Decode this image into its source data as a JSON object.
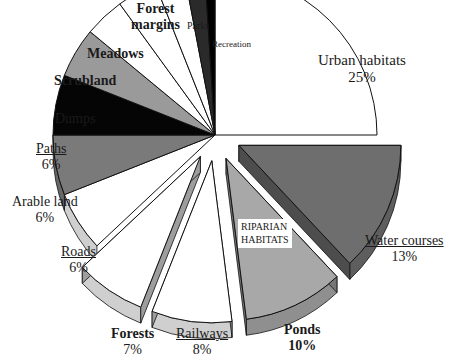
{
  "chart_data": {
    "type": "pie",
    "title": "",
    "style": "3D exploded pie, grayscale",
    "start_angle_deg": 0,
    "direction": "clockwise",
    "group_annotation": "RIPARIAN HABITATS",
    "slices": [
      {
        "label": "Urban habitats",
        "value": 25,
        "pct_label": "25%",
        "fill": "#ffffff",
        "exploded": false,
        "bold": false,
        "underline": false
      },
      {
        "label": "Water courses",
        "value": 13,
        "pct_label": "13%",
        "fill": "#6e6e6e",
        "exploded": true,
        "bold": false,
        "underline": true
      },
      {
        "label": "Ponds",
        "value": 10,
        "pct_label": "10%",
        "fill": "#a8a8a8",
        "exploded": true,
        "bold": true,
        "underline": false
      },
      {
        "label": "Railways",
        "value": 8,
        "pct_label": "8%",
        "fill": "#ffffff",
        "exploded": true,
        "bold": false,
        "underline": true
      },
      {
        "label": "Forests",
        "value": 7,
        "pct_label": "7%",
        "fill": "#ffffff",
        "exploded": true,
        "bold": true,
        "underline": false
      },
      {
        "label": "Roads",
        "value": 6,
        "pct_label": "6%",
        "fill": "#ffffff",
        "exploded": false,
        "bold": false,
        "underline": true
      },
      {
        "label": "Arable land",
        "value": 6,
        "pct_label": "6%",
        "fill": "#7a7a7a",
        "exploded": false,
        "bold": false,
        "underline": false
      },
      {
        "label": "Paths",
        "value": 6,
        "pct_label": "6%",
        "fill": "#050505",
        "exploded": false,
        "bold": false,
        "underline": true
      },
      {
        "label": "Dumps",
        "value": 5,
        "pct_label": "",
        "fill": "#9a9a9a",
        "exploded": false,
        "bold": false,
        "underline": false
      },
      {
        "label": "Scrubland",
        "value": 4,
        "pct_label": "",
        "fill": "#ffffff",
        "exploded": false,
        "bold": true,
        "underline": false
      },
      {
        "label": "Meadows",
        "value": 4,
        "pct_label": "",
        "fill": "#ffffff",
        "exploded": false,
        "bold": true,
        "underline": false
      },
      {
        "label": "Forest margins",
        "value": 3,
        "pct_label": "",
        "fill": "#ffffff",
        "exploded": false,
        "bold": true,
        "underline": false
      },
      {
        "label": "Parks",
        "value": 2,
        "pct_label": "",
        "fill": "#2a2a2a",
        "exploded": false,
        "bold": false,
        "underline": false
      },
      {
        "label": "Recreation",
        "value": 1,
        "pct_label": "",
        "fill": "#000000",
        "exploded": false,
        "bold": false,
        "underline": false
      }
    ]
  },
  "labels": {
    "urban": {
      "name": "Urban habitats",
      "pct": "25%"
    },
    "water": {
      "name": "Water courses",
      "pct": "13%"
    },
    "ponds": {
      "name": "Ponds",
      "pct": "10%"
    },
    "railways": {
      "name": "Railways",
      "pct": "8%"
    },
    "forests": {
      "name": "Forests",
      "pct": "7%"
    },
    "roads": {
      "name": "Roads",
      "pct": "6%"
    },
    "arable": {
      "name": "Arable land",
      "pct": "6%"
    },
    "paths": {
      "name": "Paths",
      "pct": "6%"
    },
    "dumps": {
      "name": "Dumps"
    },
    "scrubland": {
      "name": "Scrubland"
    },
    "meadows": {
      "name": "Meadows"
    },
    "forest_margins": {
      "name1": "Forest",
      "name2": "margins"
    },
    "parks": {
      "name": "Parks"
    },
    "recreation": {
      "name": "Recreation"
    },
    "riparian": {
      "line1": "RIPARIAN",
      "line2": "HABITATS"
    }
  }
}
